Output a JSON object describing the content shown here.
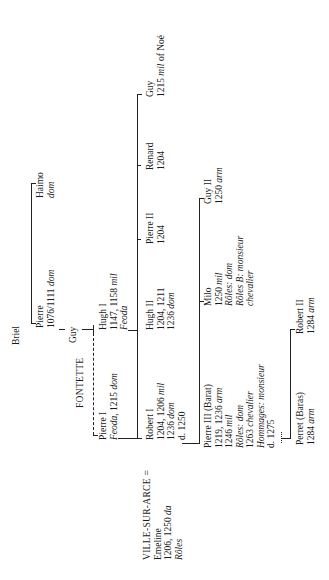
{
  "diagram": {
    "type": "genealogical-tree",
    "orientation": "rotated-90-ccw",
    "nodes": {
      "briel": {
        "lines": [
          "Briel"
        ]
      },
      "pierre_root": {
        "name": "Pierre",
        "detail": "1076/1111 ",
        "detail_it": "dom"
      },
      "haimo": {
        "name": "Haimo",
        "detail_it": "dom"
      },
      "guy_gen2": {
        "name": "Guy"
      },
      "hugh1": {
        "name": "Hugh I",
        "detail": "1147, 1158 ",
        "detail_it": "mil",
        "note_it": "Feoda"
      },
      "fontette": {
        "label": "FONTETTE"
      },
      "pierre1": {
        "name": "Pierre I",
        "detail_it": "Feoda,",
        "detail": " 1215 ",
        "detail_it2": "dom"
      },
      "ville_sur_arce": {
        "label": "VILLE-SUR-ARCE =",
        "spouse": "Emeline",
        "spouse_detail": "1206, 1250 ",
        "spouse_detail_it": "da",
        "spouse_note_it": "Rôles"
      },
      "robert1": {
        "name": "Robert I",
        "l1": "1204, 1206 ",
        "l1_it": "mil",
        "l2": "1236 ",
        "l2_it": "dom",
        "l3": "d. 1250"
      },
      "hugh2": {
        "name": "Hugh II",
        "l1": "1204, 1211",
        "l2": "1236 ",
        "l2_it": "dom"
      },
      "pierre2": {
        "name": "Pierre II",
        "l1": "1204"
      },
      "renard": {
        "name": "Renard",
        "l1": "1204"
      },
      "guy_noe": {
        "name": "Guy",
        "l1": "1215 ",
        "l1_it": "mil",
        "l1_tail": " of Noé"
      },
      "pierre3": {
        "name": "Pierre III (Barat)",
        "l1": "1219, 1236 ",
        "l1_it": "arm",
        "l2": "1246 ",
        "l2_it": "mil",
        "l3_it": "Rôles: dom",
        "l4": "1263 ",
        "l4_it": "chevalier",
        "l5_it": "Hommages: monsieur",
        "l6": "d. 1275"
      },
      "milo": {
        "name": "Milo",
        "l1": "1250 ",
        "l1_it": "mil",
        "l2_it": "Rôles: dom",
        "l3_it": "Rôles B: monsieur",
        "l4_it": "chevalier"
      },
      "guy2": {
        "name": "Guy II",
        "l1": "1250 ",
        "l1_it": "arm"
      },
      "perret": {
        "name": "Perret (Baras)",
        "l1": "1284 ",
        "l1_it": "arm"
      },
      "robert2": {
        "name": "Robert II",
        "l1": "1284 ",
        "l1_it": "arm"
      }
    }
  }
}
